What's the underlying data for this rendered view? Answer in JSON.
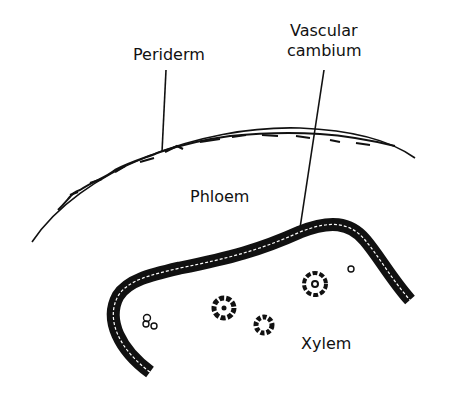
{
  "diagram": {
    "labels": {
      "periderm": "Periderm",
      "vascular_cambium_line1": "Vascular",
      "vascular_cambium_line2": "cambium",
      "phloem": "Phloem",
      "xylem": "Xylem"
    },
    "colors": {
      "ink": "#111111",
      "background": "#ffffff"
    }
  }
}
